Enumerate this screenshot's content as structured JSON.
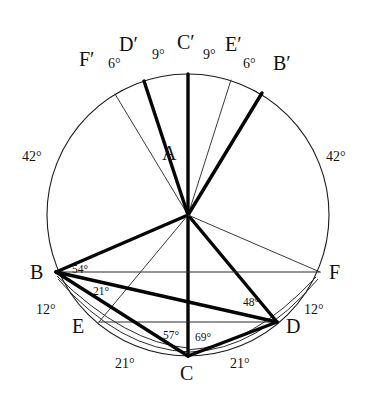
{
  "figure": {
    "type": "geometry-diagram",
    "circle": {
      "center_label": "A",
      "center_x": 188,
      "center_y": 215,
      "radius": 141
    }
  },
  "points": [
    {
      "id": "A",
      "label": "A",
      "x": 188,
      "y": 215,
      "label_x": 162,
      "label_y": 143,
      "kind": "center"
    },
    {
      "id": "B",
      "label": "B",
      "x": 56,
      "y": 272,
      "label_x": 30,
      "label_y": 262,
      "kind": "circumference"
    },
    {
      "id": "C",
      "label": "C",
      "x": 188,
      "y": 356,
      "label_x": 180,
      "label_y": 363,
      "kind": "circumference"
    },
    {
      "id": "D",
      "label": "D",
      "x": 277,
      "y": 322,
      "label_x": 286,
      "label_y": 316,
      "kind": "circumference"
    },
    {
      "id": "E",
      "label": "E",
      "x": 99,
      "y": 322,
      "label_x": 72,
      "label_y": 316,
      "kind": "circumference"
    },
    {
      "id": "F",
      "label": "F",
      "x": 320,
      "y": 272,
      "label_x": 329,
      "label_y": 262,
      "kind": "circumference"
    },
    {
      "id": "Bp",
      "label": "B′",
      "x": 262,
      "y": 93,
      "label_x": 273,
      "label_y": 53,
      "kind": "arc-mark"
    },
    {
      "id": "Cp",
      "label": "C′",
      "x": 188,
      "y": 74,
      "label_x": 177,
      "label_y": 32,
      "kind": "arc-mark"
    },
    {
      "id": "Dp",
      "label": "D′",
      "x": 144,
      "y": 81,
      "label_x": 119,
      "label_y": 34,
      "kind": "arc-mark"
    },
    {
      "id": "Ep",
      "label": "E′",
      "x": 231,
      "y": 80,
      "label_x": 225,
      "label_y": 34,
      "kind": "arc-mark"
    },
    {
      "id": "Fp",
      "label": "F′",
      "x": 115,
      "y": 94,
      "label_x": 79,
      "label_y": 49,
      "kind": "arc-mark"
    }
  ],
  "angle_labels": [
    {
      "id": "arc-left-42",
      "text": "42°",
      "x": 22,
      "y": 150,
      "size": "normal"
    },
    {
      "id": "arc-right-42",
      "text": "42°",
      "x": 326,
      "y": 150,
      "size": "normal"
    },
    {
      "id": "arc-top-6-left",
      "text": "6°",
      "x": 108,
      "y": 57,
      "size": "normal"
    },
    {
      "id": "arc-top-9-left",
      "text": "9°",
      "x": 152,
      "y": 48,
      "size": "normal"
    },
    {
      "id": "arc-top-9-right",
      "text": "9°",
      "x": 203,
      "y": 48,
      "size": "normal"
    },
    {
      "id": "arc-top-6-right",
      "text": "6°",
      "x": 243,
      "y": 57,
      "size": "normal"
    },
    {
      "id": "angle-at-B-54",
      "text": "54°",
      "x": 72,
      "y": 264,
      "size": "small"
    },
    {
      "id": "angle-at-B-21",
      "text": "21°",
      "x": 93,
      "y": 286,
      "size": "small"
    },
    {
      "id": "arc-left-12",
      "text": "12°",
      "x": 36,
      "y": 303,
      "size": "normal"
    },
    {
      "id": "arc-right-12",
      "text": "12°",
      "x": 304,
      "y": 303,
      "size": "normal"
    },
    {
      "id": "angle-at-D-48",
      "text": "48°",
      "x": 243,
      "y": 297,
      "size": "small"
    },
    {
      "id": "angle-at-C-57",
      "text": "57°",
      "x": 163,
      "y": 330,
      "size": "small"
    },
    {
      "id": "angle-at-C-69",
      "text": "69°",
      "x": 195,
      "y": 332,
      "size": "small"
    },
    {
      "id": "arc-bottom-21-left",
      "text": "21°",
      "x": 115,
      "y": 357,
      "size": "normal"
    },
    {
      "id": "arc-bottom-21-right",
      "text": "21°",
      "x": 230,
      "y": 357,
      "size": "normal"
    }
  ],
  "segments": [
    {
      "id": "A-Cp",
      "from": "A",
      "to": "Cp",
      "weight": "thick"
    },
    {
      "id": "A-Dp",
      "from": "A",
      "to": "Dp",
      "weight": "thick"
    },
    {
      "id": "A-Bp",
      "from": "A",
      "to": "Bp",
      "weight": "thick"
    },
    {
      "id": "A-Fp",
      "from": "A",
      "to": "Fp",
      "weight": "thin"
    },
    {
      "id": "A-Ep",
      "from": "A",
      "to": "Ep",
      "weight": "thin"
    },
    {
      "id": "A-B",
      "from": "A",
      "to": "B",
      "weight": "thick"
    },
    {
      "id": "A-C",
      "from": "A",
      "to": "C",
      "weight": "thick"
    },
    {
      "id": "A-D",
      "from": "A",
      "to": "D",
      "weight": "thick"
    },
    {
      "id": "A-E",
      "from": "A",
      "to": "E",
      "weight": "thin"
    },
    {
      "id": "A-F",
      "from": "A",
      "to": "F",
      "weight": "thin"
    },
    {
      "id": "B-F",
      "from": "B",
      "to": "F",
      "weight": "thin"
    },
    {
      "id": "E-D",
      "from": "E",
      "to": "D",
      "weight": "thin"
    },
    {
      "id": "B-D",
      "from": "B",
      "to": "D",
      "weight": "thick"
    },
    {
      "id": "B-C",
      "from": "B",
      "to": "C",
      "weight": "thick"
    },
    {
      "id": "C-D",
      "from": "C",
      "to": "D",
      "weight": "thick"
    }
  ],
  "colors": {
    "stroke_dark": "#050505",
    "stroke_light": "#3a3a3a",
    "background": "#ffffff",
    "text": "#111111"
  }
}
